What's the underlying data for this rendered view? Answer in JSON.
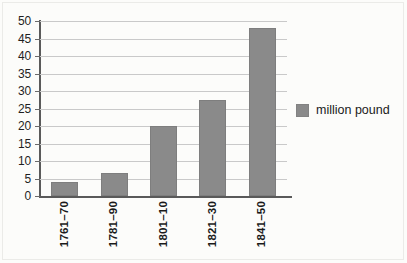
{
  "chart_data": {
    "type": "bar",
    "title": "",
    "subtitle": "",
    "xlabel": "",
    "ylabel": "",
    "categories": [
      "1761–70",
      "1781–90",
      "1801–10",
      "1821–30",
      "1841–50"
    ],
    "values": [
      4,
      6.7,
      20,
      27.3,
      48
    ],
    "series": [
      {
        "name": "million pound",
        "values": [
          4,
          6.7,
          20,
          27.3,
          48
        ],
        "color": "#8a8a8a"
      }
    ],
    "ylim": [
      0,
      50
    ],
    "ytick_step": 5,
    "yticks": [
      0,
      5,
      10,
      15,
      20,
      25,
      30,
      35,
      40,
      45,
      50
    ],
    "ytick_labels": [
      "0",
      "5",
      "10",
      "15",
      "20",
      "25",
      "30",
      "35",
      "40",
      "45",
      "50"
    ],
    "grid": true,
    "grid_axis": "y",
    "legend": {
      "position": "right",
      "entries": [
        {
          "label": "million pound",
          "color": "#8a8a8a",
          "swatch": "legend-swatch"
        }
      ]
    },
    "colors": {
      "bar": "#8a8a8a",
      "axis": "#5a5a5a",
      "gridline": "#c9c9c9",
      "text": "#1a1a1a",
      "background": "#fcfcfa"
    }
  }
}
